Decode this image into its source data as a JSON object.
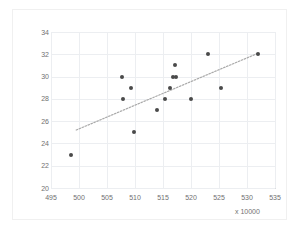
{
  "chart_data": {
    "type": "scatter",
    "title": "",
    "xlabel": "x 10000",
    "ylabel": "",
    "xlim": [
      495,
      535
    ],
    "ylim": [
      20,
      34
    ],
    "xticks": [
      495,
      500,
      505,
      510,
      515,
      520,
      525,
      530,
      535
    ],
    "yticks": [
      20,
      22,
      24,
      26,
      28,
      30,
      32,
      34
    ],
    "grid": true,
    "legend": "none",
    "marker_color": "#4a4a4a",
    "gridline_color": "#eceef1",
    "trendline": {
      "visible": true,
      "style": "dotted",
      "color": "#a9a9a9",
      "x_start": 499.5,
      "y_start": 25.2,
      "x_end": 532.0,
      "y_end": 32.1
    },
    "points": [
      {
        "x": 498.5,
        "y": 23
      },
      {
        "x": 507.7,
        "y": 30
      },
      {
        "x": 507.8,
        "y": 28
      },
      {
        "x": 509.3,
        "y": 29
      },
      {
        "x": 509.8,
        "y": 25
      },
      {
        "x": 514.0,
        "y": 27
      },
      {
        "x": 515.3,
        "y": 28
      },
      {
        "x": 516.3,
        "y": 29
      },
      {
        "x": 516.8,
        "y": 30
      },
      {
        "x": 517.3,
        "y": 30
      },
      {
        "x": 517.2,
        "y": 31
      },
      {
        "x": 520.0,
        "y": 28
      },
      {
        "x": 523.0,
        "y": 32
      },
      {
        "x": 525.3,
        "y": 29
      },
      {
        "x": 532.0,
        "y": 32
      }
    ]
  }
}
